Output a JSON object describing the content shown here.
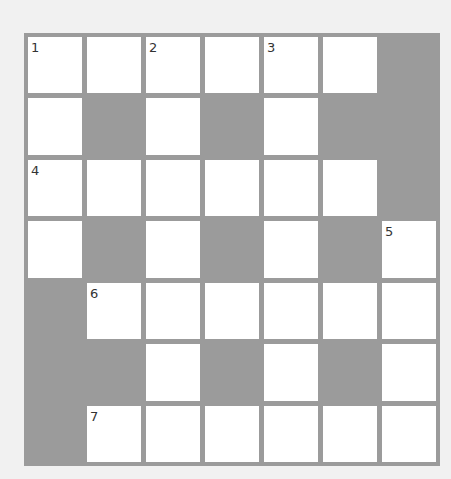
{
  "puzzle": {
    "type": "crossword",
    "rows": 7,
    "cols": 7,
    "colors": {
      "background": "#f1f1f1",
      "grid": "#9b9b9b",
      "cell": "#ffffff",
      "number": "#333333"
    },
    "layout": [
      "WWWWWWB",
      "WBWBWBB",
      "WWWWWWB",
      "WBWBWBW",
      "BWWWWWW",
      "BBWBWBW",
      "BWWWWWW"
    ],
    "numbers": [
      {
        "row": 0,
        "col": 0,
        "label": "1"
      },
      {
        "row": 0,
        "col": 2,
        "label": "2"
      },
      {
        "row": 0,
        "col": 4,
        "label": "3"
      },
      {
        "row": 2,
        "col": 0,
        "label": "4"
      },
      {
        "row": 3,
        "col": 6,
        "label": "5"
      },
      {
        "row": 4,
        "col": 1,
        "label": "6"
      },
      {
        "row": 6,
        "col": 1,
        "label": "7"
      }
    ]
  }
}
